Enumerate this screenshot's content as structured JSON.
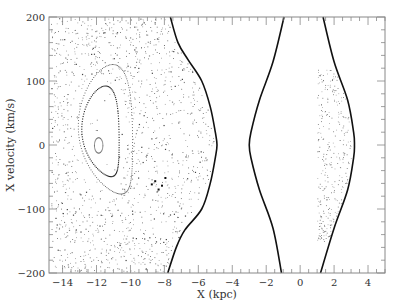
{
  "chart_data": {
    "type": "scatter",
    "title": "",
    "xlabel": "X (kpc)",
    "ylabel": "X velocity (km/s)",
    "xlim": [
      -14.8,
      5.0
    ],
    "ylim": [
      -200,
      200
    ],
    "xticks": [
      -14,
      -12,
      -10,
      -8,
      -6,
      -4,
      -2,
      0,
      2,
      4
    ],
    "yticks": [
      -200,
      -100,
      0,
      100,
      200
    ],
    "grid": false,
    "legend": null,
    "curves": [
      {
        "name": "boundary-left",
        "points": [
          [
            -7.65,
            200
          ],
          [
            -7.2,
            160
          ],
          [
            -6.6,
            133
          ],
          [
            -5.8,
            100
          ],
          [
            -5.3,
            60
          ],
          [
            -5.0,
            20
          ],
          [
            -4.9,
            0
          ],
          [
            -5.0,
            -20
          ],
          [
            -5.3,
            -60
          ],
          [
            -5.8,
            -100
          ],
          [
            -6.8,
            -133
          ],
          [
            -7.3,
            -160
          ],
          [
            -7.8,
            -200
          ]
        ]
      },
      {
        "name": "boundary-middle",
        "points": [
          [
            -0.95,
            200
          ],
          [
            -1.6,
            130
          ],
          [
            -2.4,
            70
          ],
          [
            -2.9,
            20
          ],
          [
            -3.0,
            0
          ],
          [
            -2.9,
            -20
          ],
          [
            -2.4,
            -70
          ],
          [
            -1.6,
            -130
          ],
          [
            -1.1,
            -200
          ]
        ]
      },
      {
        "name": "boundary-right",
        "points": [
          [
            1.35,
            200
          ],
          [
            2.0,
            130
          ],
          [
            2.8,
            70
          ],
          [
            3.15,
            20
          ],
          [
            3.2,
            0
          ],
          [
            3.15,
            -20
          ],
          [
            2.8,
            -70
          ],
          [
            2.0,
            -130
          ],
          [
            1.2,
            -200
          ]
        ]
      }
    ],
    "islands": [
      {
        "name": "inner",
        "center": [
          -11.9,
          0
        ],
        "rx": 0.25,
        "ry": 12
      },
      {
        "name": "middle",
        "center": [
          -11.8,
          15
        ],
        "rx": 1.1,
        "ry": 70
      },
      {
        "name": "outer",
        "center": [
          -11.5,
          15
        ],
        "rx": 1.6,
        "ry": 100
      }
    ],
    "scatter_regions": [
      {
        "name": "outer-chaotic",
        "x_range": [
          -14.8,
          -5.0
        ],
        "y_range": [
          -200,
          200
        ]
      },
      {
        "name": "right-lobe",
        "x_range": [
          1.0,
          3.2
        ],
        "y_range": [
          -150,
          120
        ]
      }
    ]
  }
}
